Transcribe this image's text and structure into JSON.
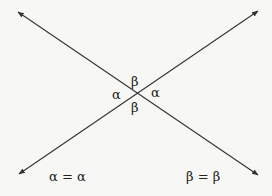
{
  "diagram": {
    "line_color": "#333333",
    "background": "#f7f7f5",
    "lines": [
      {
        "name": "line-1",
        "from": [
          18,
          12
        ],
        "to": [
          258,
          175
        ],
        "arrows": "both"
      },
      {
        "name": "line-2",
        "from": [
          19,
          174
        ],
        "to": [
          258,
          11
        ],
        "arrows": "both"
      }
    ],
    "intersection": [
      136,
      93
    ],
    "angle_labels": {
      "top": "β",
      "left": "α",
      "right": "α",
      "bottom": "β"
    },
    "equations": {
      "alpha": "α = α",
      "beta": "β = β"
    }
  }
}
